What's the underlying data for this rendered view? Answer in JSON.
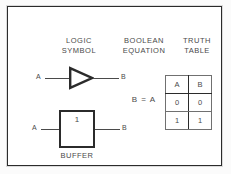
{
  "figure": {
    "headings": {
      "logic_symbol": "LOGIC\nSYMBOL",
      "boolean_equation": "BOOLEAN\nEQUATION",
      "truth_table": "TRUTH\nTABLE"
    },
    "distinctive_symbol": {
      "input_label": "A",
      "output_label": "B",
      "shape": "triangle-buffer"
    },
    "rectangular_symbol": {
      "input_label": "A",
      "output_label": "B",
      "inner_label": "1",
      "caption": "BUFFER"
    },
    "equation": "B = A",
    "truth_table": {
      "columns": [
        "A",
        "B"
      ],
      "rows": [
        [
          "0",
          "0"
        ],
        [
          "1",
          "1"
        ]
      ]
    },
    "colors": {
      "ink": "#2b2b2b",
      "text": "#4a4a4a",
      "paper": "#ffffff",
      "page": "#fbfbfb"
    }
  }
}
